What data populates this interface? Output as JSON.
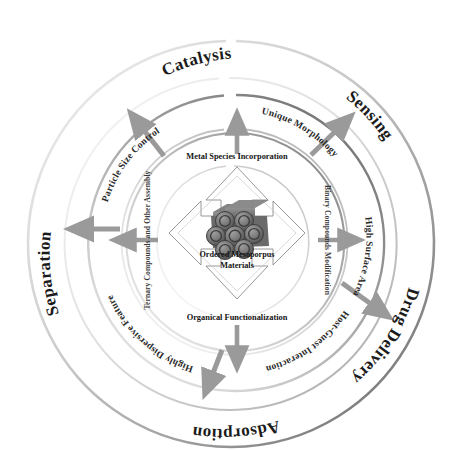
{
  "figure": {
    "center_core": {
      "label_line1": "Ordered Mesoporpus",
      "label_line2": "Materials",
      "graphic_name": "hexagonal-mesoporous-channel-cluster"
    },
    "core_arrow_labels": [
      {
        "id": "top",
        "text": "Metal Species Incorporation"
      },
      {
        "id": "right",
        "text": "Binary Compounds Modification"
      },
      {
        "id": "bottom",
        "text": "Organical Functionalization"
      },
      {
        "id": "left",
        "text": "Ternary Compounds and Other Assembly"
      }
    ],
    "inner_ring_labels": [
      {
        "id": "particle-size-control",
        "text": "Particle Size Control"
      },
      {
        "id": "unique-morphology",
        "text": "Unique Morphology"
      },
      {
        "id": "high-surface-area",
        "text": "High Surface Area"
      },
      {
        "id": "host-guest-interaction",
        "text": "Host-Guest Interaction"
      },
      {
        "id": "highly-dispersive",
        "text": "Highly Dispersive Feature"
      }
    ],
    "outer_ring_labels": [
      {
        "id": "catalysis",
        "text": "Catalysis"
      },
      {
        "id": "sensing",
        "text": "Sensing"
      },
      {
        "id": "drug-delivery",
        "text": "Drug Delivery"
      },
      {
        "id": "adsorption",
        "text": "Adsorption"
      },
      {
        "id": "separation",
        "text": "Separation"
      }
    ],
    "colors": {
      "arrow_gray": "#9a9a9a",
      "ring_dark": "#6e6e6e",
      "ring_light": "#e2e2e2",
      "core_outline": "#8c8c8c",
      "particle_dark": "#5e5e5e",
      "particle_light": "#8f8f8f",
      "text_dark": "#1b1b1b",
      "background": "#ffffff"
    }
  }
}
